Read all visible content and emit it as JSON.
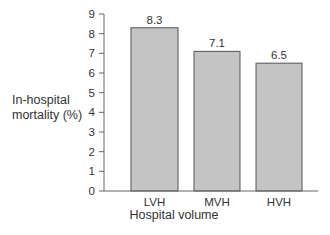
{
  "chart_data": {
    "type": "bar",
    "title": "",
    "xlabel": "Hospital volume",
    "ylabel": "In-hospital mortality (%)",
    "ylabel_lines": [
      "In-hospital",
      "mortality (%)"
    ],
    "categories": [
      "LVH",
      "MVH",
      "HVH"
    ],
    "values": [
      8.3,
      7.1,
      6.5
    ],
    "value_labels": [
      "8.3",
      "7.1",
      "6.5"
    ],
    "ylim": [
      0,
      9
    ],
    "yticks": [
      0,
      1,
      2,
      3,
      4,
      5,
      6,
      7,
      8,
      9
    ],
    "grid": false,
    "legend": null,
    "colors": {
      "bar_fill": "#c4c4c4",
      "bar_stroke": "#555555",
      "axis": "#666666",
      "text": "#333333"
    }
  }
}
